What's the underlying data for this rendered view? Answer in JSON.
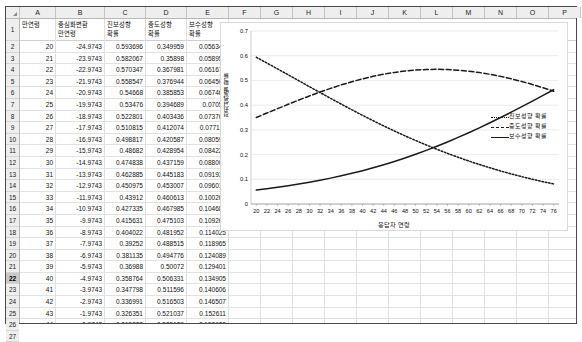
{
  "spreadsheet": {
    "corner_icon": "select-all-triangle-icon",
    "column_letters": [
      "A",
      "B",
      "C",
      "D",
      "E",
      "F",
      "G",
      "H",
      "I",
      "J",
      "K",
      "L",
      "M",
      "N",
      "O",
      "P"
    ],
    "selected_row_header": "22",
    "headers": [
      "만연령",
      "중심화변환 만연령",
      "진보성향 확률",
      "중도성향 확률",
      "보수성향 확률"
    ],
    "header_lines": [
      [
        "만연령",
        ""
      ],
      [
        "중심화변환",
        "만연령"
      ],
      [
        "진보성향",
        "확률"
      ],
      [
        "중도성향",
        "확률"
      ],
      [
        "보수성향",
        "확률"
      ]
    ],
    "row_numbers": [
      "1",
      "2",
      "3",
      "4",
      "5",
      "6",
      "7",
      "8",
      "9",
      "10",
      "11",
      "12",
      "13",
      "14",
      "15",
      "16",
      "17",
      "18",
      "19",
      "20",
      "21",
      "22",
      "23",
      "24",
      "25",
      "26",
      "27"
    ],
    "rows": [
      [
        "20",
        "-24.9743",
        "0.593696",
        "0.349959",
        "0.056345"
      ],
      [
        "21",
        "-23.9743",
        "0.582067",
        "0.35898",
        "0.058952"
      ],
      [
        "22",
        "-22.9743",
        "0.570347",
        "0.367981",
        "0.061672"
      ],
      [
        "23",
        "-21.9743",
        "0.558547",
        "0.376944",
        "0.064509"
      ],
      [
        "24",
        "-20.9743",
        "0.54668",
        "0.385853",
        "0.067467"
      ],
      [
        "25",
        "-19.9743",
        "0.53476",
        "0.394689",
        "0.07055"
      ],
      [
        "26",
        "-18.9743",
        "0.522801",
        "0.403436",
        "0.073763"
      ],
      [
        "27",
        "-17.9743",
        "0.510815",
        "0.412074",
        "0.077111"
      ],
      [
        "28",
        "-16.9743",
        "0.498817",
        "0.420587",
        "0.080597"
      ],
      [
        "29",
        "-15.9743",
        "0.48682",
        "0.428954",
        "0.084226"
      ],
      [
        "30",
        "-14.9743",
        "0.474838",
        "0.437159",
        "0.088003"
      ],
      [
        "31",
        "-13.9743",
        "0.462885",
        "0.445183",
        "0.091932"
      ],
      [
        "32",
        "-12.9743",
        "0.450975",
        "0.453007",
        "0.096019"
      ],
      [
        "33",
        "-11.9743",
        "0.43912",
        "0.460613",
        "0.100267"
      ],
      [
        "34",
        "-10.9743",
        "0.427335",
        "0.467985",
        "0.104681"
      ],
      [
        "35",
        "-9.9743",
        "0.415631",
        "0.475103",
        "0.109265"
      ],
      [
        "36",
        "-8.9743",
        "0.404022",
        "0.481952",
        "0.114025"
      ],
      [
        "37",
        "-7.9743",
        "0.39252",
        "0.488515",
        "0.118965"
      ],
      [
        "38",
        "-6.9743",
        "0.381135",
        "0.494776",
        "0.124089"
      ],
      [
        "39",
        "-5.9743",
        "0.36988",
        "0.50072",
        "0.129401"
      ],
      [
        "40",
        "-4.9743",
        "0.358764",
        "0.506331",
        "0.134905"
      ],
      [
        "41",
        "-3.9743",
        "0.347798",
        "0.511596",
        "0.140606"
      ],
      [
        "42",
        "-2.9743",
        "0.336991",
        "0.516503",
        "0.146507"
      ],
      [
        "43",
        "-1.9743",
        "0.326351",
        "0.521037",
        "0.152611"
      ],
      [
        "44",
        "-0.9743",
        "0.315888",
        "0.525189",
        "0.158923"
      ],
      [
        "45",
        "0.0257",
        "0.305608",
        "0.528948",
        "0.165444"
      ]
    ]
  },
  "chart_data": {
    "type": "line",
    "title": "",
    "xlabel": "응답자 연령",
    "ylabel": "정치성향별 확률",
    "xlim": [
      19,
      77
    ],
    "ylim": [
      0,
      0.7
    ],
    "ytick_step": 0.1,
    "yticks": [
      "0",
      "0.1",
      "0.2",
      "0.3",
      "0.4",
      "0.5",
      "0.6",
      "0.7"
    ],
    "xticks": [
      "20",
      "22",
      "24",
      "26",
      "28",
      "30",
      "32",
      "34",
      "36",
      "38",
      "40",
      "42",
      "44",
      "46",
      "48",
      "50",
      "52",
      "54",
      "56",
      "58",
      "60",
      "62",
      "64",
      "66",
      "68",
      "70",
      "72",
      "74",
      "76"
    ],
    "grid": true,
    "legend_position": "right",
    "x": [
      20,
      22,
      24,
      26,
      28,
      30,
      32,
      34,
      36,
      38,
      40,
      42,
      44,
      46,
      48,
      50,
      52,
      54,
      56,
      58,
      60,
      62,
      64,
      66,
      68,
      70,
      72,
      74,
      76
    ],
    "series": [
      {
        "name": "진보성향 확률",
        "style": "dotted",
        "color": "#1a1a1a",
        "values": [
          0.5937,
          0.5703,
          0.5467,
          0.5228,
          0.4988,
          0.4748,
          0.451,
          0.4273,
          0.404,
          0.3811,
          0.3588,
          0.337,
          0.3159,
          0.2955,
          0.2758,
          0.2569,
          0.2387,
          0.2214,
          0.2048,
          0.189,
          0.174,
          0.1598,
          0.1464,
          0.1337,
          0.1218,
          0.1106,
          0.1001,
          0.0903,
          0.0812
        ]
      },
      {
        "name": "중도성향 확률",
        "style": "dashed",
        "color": "#1a1a1a",
        "values": [
          0.35,
          0.368,
          0.3859,
          0.4034,
          0.4206,
          0.4372,
          0.453,
          0.468,
          0.482,
          0.4948,
          0.5063,
          0.5165,
          0.5252,
          0.5324,
          0.538,
          0.542,
          0.5443,
          0.545,
          0.5441,
          0.5416,
          0.5375,
          0.5319,
          0.5248,
          0.5164,
          0.5067,
          0.4957,
          0.4836,
          0.4705,
          0.4565
        ]
      },
      {
        "name": "보수성향 확률",
        "style": "solid",
        "color": "#1a1a1a",
        "values": [
          0.0563,
          0.0617,
          0.0675,
          0.0738,
          0.0806,
          0.088,
          0.096,
          0.1047,
          0.114,
          0.1241,
          0.1349,
          0.1465,
          0.1589,
          0.1721,
          0.1862,
          0.2011,
          0.217,
          0.2336,
          0.2511,
          0.2694,
          0.2885,
          0.3083,
          0.3288,
          0.3499,
          0.3715,
          0.3937,
          0.4163,
          0.4392,
          0.4623
        ]
      }
    ]
  }
}
